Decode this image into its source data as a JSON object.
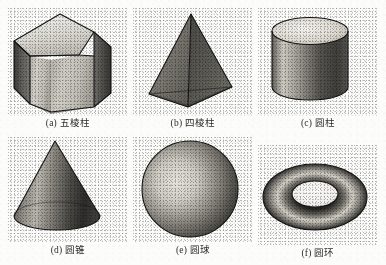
{
  "figure": {
    "background_color": "#fcfcfb",
    "ink_color": "#151515",
    "caption_color": "#2c2c2c",
    "columns": 3,
    "rows": 2
  },
  "solids": [
    {
      "key": "pentagonal-prism",
      "label": "(a) 五棱柱",
      "index": "(a)",
      "name": "五棱柱",
      "shape": "pentagonal-prism",
      "column": 1,
      "row": 1
    },
    {
      "key": "square-pyramid",
      "label": "(b) 四棱柱",
      "index": "(b)",
      "name": "四棱柱",
      "shape": "square-pyramid",
      "column": 2,
      "row": 1
    },
    {
      "key": "cylinder",
      "label": "(c) 圆柱",
      "index": "(c)",
      "name": "圆柱",
      "shape": "cylinder",
      "column": 3,
      "row": 1
    },
    {
      "key": "cone",
      "label": "(d) 圆锥",
      "index": "(d)",
      "name": "圆锥",
      "shape": "cone",
      "column": 1,
      "row": 2
    },
    {
      "key": "sphere",
      "label": "(e) 圆球",
      "index": "(e)",
      "name": "圆球",
      "shape": "sphere",
      "column": 2,
      "row": 2
    },
    {
      "key": "torus",
      "label": "(f) 圆环",
      "index": "(f)",
      "name": "圆环",
      "shape": "torus",
      "column": 3,
      "row": 2
    }
  ]
}
